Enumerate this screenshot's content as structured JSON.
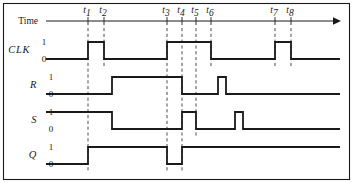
{
  "figure": {
    "kind": "timing-diagram",
    "axis_label": "Time",
    "stroke_color": "#1a1a1a",
    "dash_color": "#3a3a3a",
    "background": "#ffffff"
  },
  "time_markers": [
    {
      "id": "t1",
      "base": "t",
      "sub": "1",
      "x": 88
    },
    {
      "id": "t2",
      "base": "t",
      "sub": "2",
      "x": 104
    },
    {
      "id": "t3",
      "base": "t",
      "sub": "3",
      "x": 167
    },
    {
      "id": "t4",
      "base": "t",
      "sub": "4",
      "x": 182
    },
    {
      "id": "t5",
      "base": "t",
      "sub": "5",
      "x": 196
    },
    {
      "id": "t6",
      "base": "t",
      "sub": "6",
      "x": 211
    },
    {
      "id": "t7",
      "base": "t",
      "sub": "7",
      "x": 275
    },
    {
      "id": "t8",
      "base": "t",
      "sub": "8",
      "x": 291
    }
  ],
  "level_labels": {
    "high": "1",
    "low": "0"
  },
  "signals": [
    {
      "name": "CLK",
      "label_x": 30,
      "label_y": 53,
      "y_high": 42,
      "y_low": 59,
      "dash_bottom": 66,
      "initial": 0,
      "transitions": [
        {
          "x": 88,
          "to": 1
        },
        {
          "x": 104,
          "to": 0
        },
        {
          "x": 167,
          "to": 1
        },
        {
          "x": 211,
          "to": 0
        },
        {
          "x": 275,
          "to": 1
        },
        {
          "x": 291,
          "to": 0
        }
      ]
    },
    {
      "name": "R",
      "label_x": 37,
      "label_y": 88,
      "y_high": 77,
      "y_low": 94,
      "dash_bottom": 101,
      "initial": 0,
      "transitions": [
        {
          "x": 112,
          "to": 1
        },
        {
          "x": 182,
          "to": 0
        },
        {
          "x": 218,
          "to": 1
        },
        {
          "x": 226,
          "to": 0
        }
      ]
    },
    {
      "name": "S",
      "label_x": 37,
      "label_y": 123,
      "y_high": 112,
      "y_low": 129,
      "dash_bottom": 136,
      "initial": 1,
      "transitions": [
        {
          "x": 112,
          "to": 0
        },
        {
          "x": 182,
          "to": 1
        },
        {
          "x": 196,
          "to": 0
        },
        {
          "x": 235,
          "to": 1
        },
        {
          "x": 243,
          "to": 0
        }
      ]
    },
    {
      "name": "Q",
      "label_x": 37,
      "label_y": 158,
      "y_high": 147,
      "y_low": 164,
      "dash_bottom": 171,
      "initial": 0,
      "transitions": [
        {
          "x": 88,
          "to": 1
        },
        {
          "x": 167,
          "to": 0
        },
        {
          "x": 182,
          "to": 1
        }
      ]
    }
  ],
  "chart_data": {
    "type": "line",
    "title": "",
    "xlabel": "Time",
    "ylabel": "",
    "x_ticks": [
      "t1",
      "t2",
      "t3",
      "t4",
      "t5",
      "t6",
      "t7",
      "t8"
    ],
    "x_tick_positions": [
      88,
      104,
      167,
      182,
      196,
      211,
      275,
      291
    ],
    "ylim": [
      0,
      1
    ],
    "grid": false,
    "legend": "none",
    "series": [
      {
        "name": "CLK",
        "description": "Clock: low, pulse high t1-t2, low, high t3-t6, low, pulse high t7-t8, low",
        "points": [
          {
            "x": 46,
            "y": 0
          },
          {
            "x": 88,
            "y": 0
          },
          {
            "x": 88,
            "y": 1
          },
          {
            "x": 104,
            "y": 1
          },
          {
            "x": 104,
            "y": 0
          },
          {
            "x": 167,
            "y": 0
          },
          {
            "x": 167,
            "y": 1
          },
          {
            "x": 211,
            "y": 1
          },
          {
            "x": 211,
            "y": 0
          },
          {
            "x": 275,
            "y": 0
          },
          {
            "x": 275,
            "y": 1
          },
          {
            "x": 291,
            "y": 1
          },
          {
            "x": 291,
            "y": 0
          },
          {
            "x": 340,
            "y": 0
          }
        ]
      },
      {
        "name": "R",
        "description": "Reset: low, rises after t2, falls at t4, narrow pulse between t6 and t7",
        "points": [
          {
            "x": 46,
            "y": 0
          },
          {
            "x": 112,
            "y": 0
          },
          {
            "x": 112,
            "y": 1
          },
          {
            "x": 182,
            "y": 1
          },
          {
            "x": 182,
            "y": 0
          },
          {
            "x": 218,
            "y": 0
          },
          {
            "x": 218,
            "y": 1
          },
          {
            "x": 226,
            "y": 1
          },
          {
            "x": 226,
            "y": 0
          },
          {
            "x": 340,
            "y": 0
          }
        ]
      },
      {
        "name": "S",
        "description": "Set: high, falls after t2, rises at t4, falls at t5, narrow pulse before t7",
        "points": [
          {
            "x": 46,
            "y": 1
          },
          {
            "x": 112,
            "y": 1
          },
          {
            "x": 112,
            "y": 0
          },
          {
            "x": 182,
            "y": 0
          },
          {
            "x": 182,
            "y": 1
          },
          {
            "x": 196,
            "y": 1
          },
          {
            "x": 196,
            "y": 0
          },
          {
            "x": 235,
            "y": 0
          },
          {
            "x": 235,
            "y": 1
          },
          {
            "x": 243,
            "y": 1
          },
          {
            "x": 243,
            "y": 0
          },
          {
            "x": 340,
            "y": 0
          }
        ]
      },
      {
        "name": "Q",
        "description": "Output: low, rises at t1, falls at t3, rises at t4, stays high",
        "points": [
          {
            "x": 46,
            "y": 0
          },
          {
            "x": 88,
            "y": 0
          },
          {
            "x": 88,
            "y": 1
          },
          {
            "x": 167,
            "y": 1
          },
          {
            "x": 167,
            "y": 0
          },
          {
            "x": 182,
            "y": 0
          },
          {
            "x": 182,
            "y": 1
          },
          {
            "x": 340,
            "y": 1
          }
        ]
      }
    ]
  }
}
